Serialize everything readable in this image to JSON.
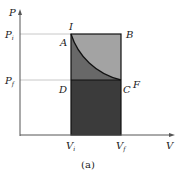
{
  "diagram": {
    "type": "pv-diagram",
    "caption": "(a)",
    "axes": {
      "x_label": "V",
      "y_label": "P",
      "x_ticks": [
        {
          "label": "V",
          "sub": "i"
        },
        {
          "label": "V",
          "sub": "f"
        }
      ],
      "y_ticks": [
        {
          "label": "P",
          "sub": "i"
        },
        {
          "label": "P",
          "sub": "f"
        }
      ]
    },
    "points": {
      "I": "I",
      "A": "A",
      "B": "B",
      "C": "C",
      "D": "D",
      "F": "F"
    },
    "colors": {
      "light_region": "#a3a3a3",
      "mid_region": "#686868",
      "dark_region": "#3b3b3b",
      "outline": "#111111",
      "guide": "#c8c8c8",
      "axis": "#555555"
    }
  }
}
